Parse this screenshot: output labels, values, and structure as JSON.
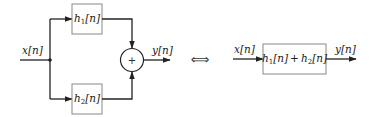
{
  "diagram": {
    "left": {
      "input_label": "x[n]",
      "output_label": "y[n]",
      "top_block": {
        "name": "h",
        "sub": "1",
        "arg": "[n]"
      },
      "bottom_block": {
        "name": "h",
        "sub": "2",
        "arg": "[n]"
      },
      "adder_symbol": "+"
    },
    "equivalence_symbol": "⟺",
    "right": {
      "input_label": "x[n]",
      "output_label": "y[n]",
      "block": {
        "term1": {
          "name": "h",
          "sub": "1",
          "arg": "[n]"
        },
        "operator": "+",
        "term2": {
          "name": "h",
          "sub": "2",
          "arg": "[n]"
        }
      }
    }
  }
}
